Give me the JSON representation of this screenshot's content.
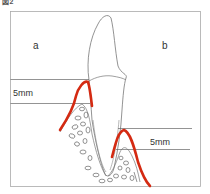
{
  "figure": {
    "caption": "図2",
    "regions": {
      "a": "a",
      "b": "b"
    },
    "measurements": {
      "left": "5mm",
      "right": "5mm"
    },
    "colors": {
      "gingiva_line": "#d42a12",
      "outline": "#666666",
      "frame": "#999999"
    }
  }
}
